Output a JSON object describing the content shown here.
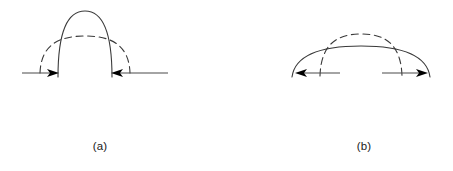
{
  "figure": {
    "background_color": "#ffffff",
    "stroke_color": "#3a3a3a",
    "arrow_color": "#000000",
    "width": 453,
    "height": 171
  },
  "panels": [
    {
      "id": "a",
      "caption": "(a)",
      "description": "Narrow tall solid arc with wider flatter dashed arc; horizontal arrows point inward",
      "arrow_direction": "inward",
      "solid_curve": {
        "style": "solid",
        "apex_x": 85,
        "apex_y": 11,
        "left_foot_x": 58,
        "right_foot_x": 112,
        "baseline_y": 73
      },
      "dashed_curve": {
        "style": "dashed",
        "apex_x": 85,
        "apex_y": 36,
        "left_foot_x": 40,
        "right_foot_x": 130,
        "baseline_y": 73
      },
      "baseline_left": {
        "x1": 22,
        "x2": 60,
        "y": 73
      },
      "baseline_right": {
        "x1": 110,
        "x2": 168,
        "y": 73
      },
      "arrows": [
        {
          "name": "left-arrow",
          "tip_x": 59,
          "tip_y": 73,
          "points": "right"
        },
        {
          "name": "right-arrow",
          "tip_x": 111,
          "tip_y": 73,
          "points": "left"
        }
      ]
    },
    {
      "id": "b",
      "caption": "(b)",
      "description": "Wide flat solid arc with narrower higher dashed arc; horizontal arrows point outward",
      "arrow_direction": "outward",
      "solid_curve": {
        "style": "solid",
        "apex_x": 361,
        "apex_y": 46,
        "left_foot_x": 292,
        "right_foot_x": 430,
        "baseline_y": 76
      },
      "dashed_curve": {
        "style": "dashed",
        "apex_x": 361,
        "apex_y": 34,
        "left_foot_x": 320,
        "right_foot_x": 402,
        "baseline_y": 76
      },
      "baseline_left": {
        "x1": 300,
        "x2": 340,
        "y": 73
      },
      "baseline_right": {
        "x1": 382,
        "x2": 424,
        "y": 73
      },
      "arrows": [
        {
          "name": "left-arrow",
          "tip_x": 296,
          "tip_y": 73,
          "points": "left"
        },
        {
          "name": "right-arrow",
          "tip_x": 428,
          "tip_y": 73,
          "points": "right"
        }
      ]
    }
  ]
}
